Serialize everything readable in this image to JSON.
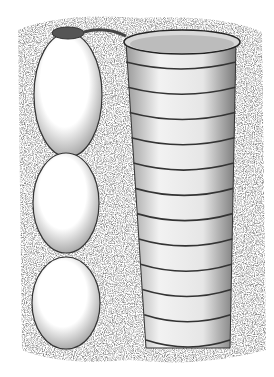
{
  "illustration": {
    "subject": "stippled drawing of a column of three egg-shaped cells beside a ringed cylindrical tube in soil",
    "style": "black ink stipple on white",
    "left_column": {
      "cells": 3,
      "top_opening": true
    },
    "right_tube": {
      "rings": 12,
      "open_top": true
    },
    "colors": {
      "ink": "#1a1a1a",
      "paper": "#ffffff",
      "shade": "#8a8a8a"
    }
  }
}
